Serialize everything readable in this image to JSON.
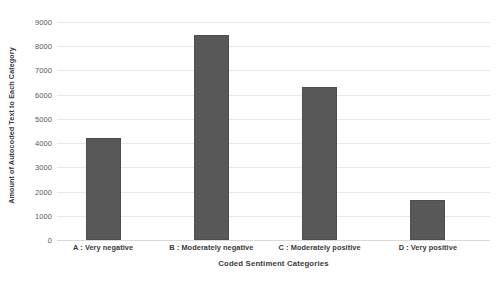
{
  "chart_data": {
    "type": "bar",
    "title": "",
    "xlabel": "Coded Sentiment Categories",
    "ylabel": "Amount of Autocoded Text to Each Category",
    "categories": [
      "A : Very negative",
      "B : Moderately negative",
      "C : Moderately positive",
      "D : Very positive"
    ],
    "values": [
      4200,
      8450,
      6300,
      1650
    ],
    "ylim": [
      0,
      9000
    ],
    "ytick_labels": [
      "0",
      "1000",
      "2000",
      "3000",
      "4000",
      "5000",
      "6000",
      "7000",
      "8000",
      "9000"
    ],
    "ytick_values": [
      0,
      1000,
      2000,
      3000,
      4000,
      5000,
      6000,
      7000,
      8000,
      9000
    ],
    "grid": true,
    "legend": false,
    "bar_color": "#585858",
    "grid_color": "#e8e8e8",
    "background_color": "#ffffff"
  }
}
